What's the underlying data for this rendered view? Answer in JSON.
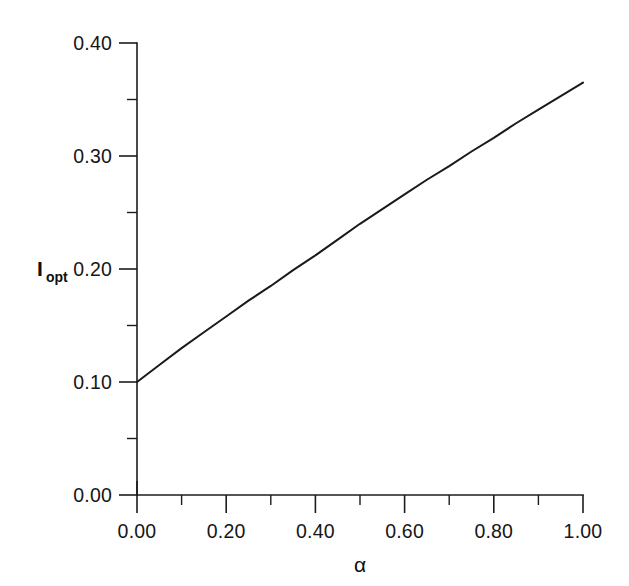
{
  "figure": {
    "background_color": "#ffffff",
    "line_color": "#1a1a1a",
    "axis_color": "#1c1c1c"
  },
  "chart_data": {
    "type": "line",
    "title": "",
    "subtitle": "",
    "xlabel": "α",
    "ylabel": "I",
    "ylabel_subscript": "opt",
    "xlim": [
      0.0,
      1.0
    ],
    "ylim": [
      0.0,
      0.4
    ],
    "grid": false,
    "legend": null,
    "legend_position": "none",
    "xticks": [
      0.0,
      0.2,
      0.4,
      0.6,
      0.8,
      1.0
    ],
    "xticklabels": [
      "0.00",
      "0.20",
      "0.40",
      "0.60",
      "0.80",
      "1.00"
    ],
    "xminorticks": [
      0.1,
      0.3,
      0.5,
      0.7,
      0.9
    ],
    "yticks": [
      0.0,
      0.1,
      0.2,
      0.3,
      0.4
    ],
    "yticklabels": [
      "0.00",
      "0.10",
      "0.20",
      "0.30",
      "0.40"
    ],
    "yminorticks": [
      0.05,
      0.15,
      0.25,
      0.35
    ],
    "series": [
      {
        "name": "I_opt",
        "x": [
          0.0,
          0.05,
          0.1,
          0.15,
          0.2,
          0.25,
          0.3,
          0.35,
          0.4,
          0.45,
          0.5,
          0.55,
          0.6,
          0.65,
          0.7,
          0.75,
          0.8,
          0.85,
          0.9,
          0.95,
          1.0
        ],
        "values": [
          0.1,
          0.115,
          0.13,
          0.144,
          0.158,
          0.172,
          0.185,
          0.199,
          0.212,
          0.226,
          0.24,
          0.253,
          0.266,
          0.279,
          0.291,
          0.304,
          0.316,
          0.329,
          0.341,
          0.353,
          0.365
        ]
      }
    ],
    "annotations": []
  },
  "axes": {
    "x_tick_labels": [
      "0.00",
      "0.20",
      "0.40",
      "0.60",
      "0.80",
      "1.00"
    ],
    "y_tick_labels": [
      "0.00",
      "0.10",
      "0.20",
      "0.30",
      "0.40"
    ],
    "x_axis_title": "α",
    "y_axis_title_base": "I",
    "y_axis_title_sub": "opt"
  }
}
